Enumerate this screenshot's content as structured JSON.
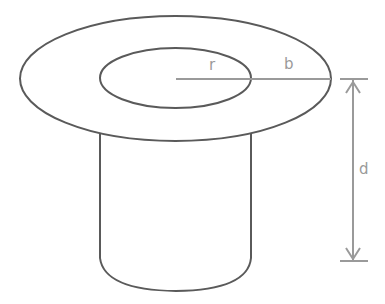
{
  "diagram": {
    "type": "top-hat / flanged cylinder cross-section",
    "labels": {
      "inner_radius": "r",
      "flange_width": "b",
      "depth": "d"
    },
    "colors": {
      "outline": "#5a5a5a",
      "dimension": "#9a9a9a",
      "background": "#ffffff"
    }
  }
}
